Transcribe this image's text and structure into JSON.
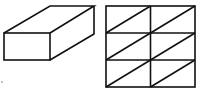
{
  "figure": {
    "stroke_color": "#111111",
    "background": "#ffffff",
    "cuboid": {
      "front_face": {
        "x": 4,
        "y": 33,
        "w": 46,
        "h": 28
      },
      "depth_offset": {
        "dx": 44,
        "dy": -27
      }
    },
    "grid": {
      "x": 106,
      "y": 6,
      "w": 89,
      "h": 81,
      "rows": 3,
      "cols": 2,
      "diagonal": "bottom-left to top-right in each cell"
    },
    "mark": "."
  }
}
